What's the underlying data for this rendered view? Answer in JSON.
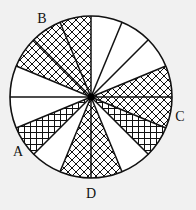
{
  "figure": {
    "center": [
      91,
      97
    ],
    "radius": 81,
    "sector_count": 16,
    "colors": {
      "background": "#f1f1f1",
      "stroke": "#111111",
      "fill": "#ffffff"
    },
    "sectors": [
      {
        "index": 0,
        "from_deg": 0,
        "to_deg": 22.5,
        "pattern": "diagonal"
      },
      {
        "index": 1,
        "from_deg": 22.5,
        "to_deg": 45,
        "pattern": "none"
      },
      {
        "index": 2,
        "from_deg": 45,
        "to_deg": 67.5,
        "pattern": "none"
      },
      {
        "index": 3,
        "from_deg": 67.5,
        "to_deg": 90,
        "pattern": "none"
      },
      {
        "index": 4,
        "from_deg": 90,
        "to_deg": 112.5,
        "pattern": "diagonal"
      },
      {
        "index": 5,
        "from_deg": 112.5,
        "to_deg": 135,
        "pattern": "diagonal"
      },
      {
        "index": 6,
        "from_deg": 135,
        "to_deg": 157.5,
        "pattern": "diagonal"
      },
      {
        "index": 7,
        "from_deg": 157.5,
        "to_deg": 180,
        "pattern": "none"
      },
      {
        "index": 8,
        "from_deg": 180,
        "to_deg": 202.5,
        "pattern": "none"
      },
      {
        "index": 9,
        "from_deg": 202.5,
        "to_deg": 225,
        "pattern": "grid"
      },
      {
        "index": 10,
        "from_deg": 225,
        "to_deg": 247.5,
        "pattern": "none"
      },
      {
        "index": 11,
        "from_deg": 247.5,
        "to_deg": 270,
        "pattern": "diagonal"
      },
      {
        "index": 12,
        "from_deg": 270,
        "to_deg": 292.5,
        "pattern": "diagonal"
      },
      {
        "index": 13,
        "from_deg": 292.5,
        "to_deg": 315,
        "pattern": "none"
      },
      {
        "index": 14,
        "from_deg": 315,
        "to_deg": 337.5,
        "pattern": "grid"
      },
      {
        "index": 15,
        "from_deg": 337.5,
        "to_deg": 360,
        "pattern": "diagonal"
      }
    ],
    "labels": [
      {
        "text": "B",
        "x": 42,
        "y": 19
      },
      {
        "text": "C",
        "x": 180,
        "y": 117
      },
      {
        "text": "A",
        "x": 18,
        "y": 152
      },
      {
        "text": "D",
        "x": 91,
        "y": 194
      }
    ]
  }
}
